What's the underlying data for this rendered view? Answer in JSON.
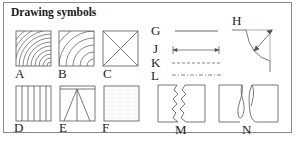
{
  "title": "Drawing symbols",
  "symbols": {
    "A": {
      "label": "A",
      "icon": "wood-end-grain-tight"
    },
    "B": {
      "label": "B",
      "icon": "wood-end-grain-wide"
    },
    "C": {
      "label": "C",
      "icon": "crossed-box"
    },
    "D": {
      "label": "D",
      "icon": "vertical-grain"
    },
    "E": {
      "label": "E",
      "icon": "triangle-box"
    },
    "F": {
      "label": "F",
      "icon": "stippled-box"
    },
    "G": {
      "label": "G",
      "icon": "solid-line"
    },
    "H": {
      "label": "H",
      "icon": "radius-profile"
    },
    "J": {
      "label": "J",
      "icon": "dimension-line"
    },
    "K": {
      "label": "K",
      "icon": "dashed-line"
    },
    "L": {
      "label": "L",
      "icon": "dash-dot-line"
    },
    "M": {
      "label": "M",
      "icon": "zigzag-break"
    },
    "N": {
      "label": "N",
      "icon": "curved-break"
    }
  },
  "colors": {
    "stroke": "#555555",
    "frame": "#8a8a8a",
    "text": "#222222"
  }
}
